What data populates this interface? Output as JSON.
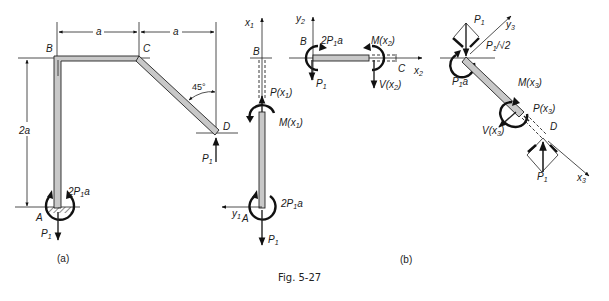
{
  "figure": {
    "caption": "Fig. 5-27",
    "panel_a": {
      "label": "(a)",
      "points": {
        "A": "A",
        "B": "B",
        "C": "C",
        "D": "D"
      },
      "dims": {
        "ab_width": "a",
        "cd_width": "a",
        "height": "2a"
      },
      "angle": "45°",
      "load_D": "P",
      "load_D_sub": "1",
      "reaction_force": "P",
      "reaction_force_sub": "1",
      "reaction_moment_pre": "2",
      "reaction_moment_P": "P",
      "reaction_moment_sub": "1",
      "reaction_moment_post": "a"
    },
    "panel_b": {
      "label": "(b)",
      "seg1": {
        "axis_x": "x",
        "axis_x_sub": "1",
        "axis_y": "y",
        "axis_y_sub": "1",
        "point_top": "B",
        "point_bottom": "A",
        "internal_force": "P(x",
        "internal_force_sub": "1",
        "internal_force_close": ")",
        "internal_moment": "M(x",
        "internal_moment_sub": "1",
        "internal_moment_close": ")",
        "moment_pre": "2",
        "moment_P": "P",
        "moment_sub": "1",
        "moment_post": "a",
        "force": "P",
        "force_sub": "1"
      },
      "seg2": {
        "axis_x": "x",
        "axis_x_sub": "2",
        "axis_y": "y",
        "axis_y_sub": "2",
        "point_left": "B",
        "point_right": "C",
        "moment_pre": "2",
        "moment_P": "P",
        "moment_sub": "1",
        "moment_post": "a",
        "force": "P",
        "force_sub": "1",
        "internal_moment": "M(x",
        "internal_moment_sub": "2",
        "internal_moment_close": ")",
        "shear": "V(x",
        "shear_sub": "2",
        "shear_close": ")"
      },
      "seg3": {
        "axis_x": "x",
        "axis_x_sub": "3",
        "axis_y": "y",
        "axis_y_sub": "3",
        "point_end": "D",
        "top_force": "P",
        "top_force_sub": "1",
        "component": "P",
        "component_sub": "1",
        "component_tail": "/√2",
        "moment_P": "P",
        "moment_sub": "1",
        "moment_post": "a",
        "internal_moment": "M(x",
        "internal_moment_sub": "3",
        "internal_moment_close": ")",
        "internal_force": "P(x",
        "internal_force_sub": "3",
        "internal_force_close": ")",
        "shear": "V(x",
        "shear_sub": "3",
        "shear_close": ")",
        "bottom_force": "P",
        "bottom_force_sub": "1"
      }
    }
  }
}
